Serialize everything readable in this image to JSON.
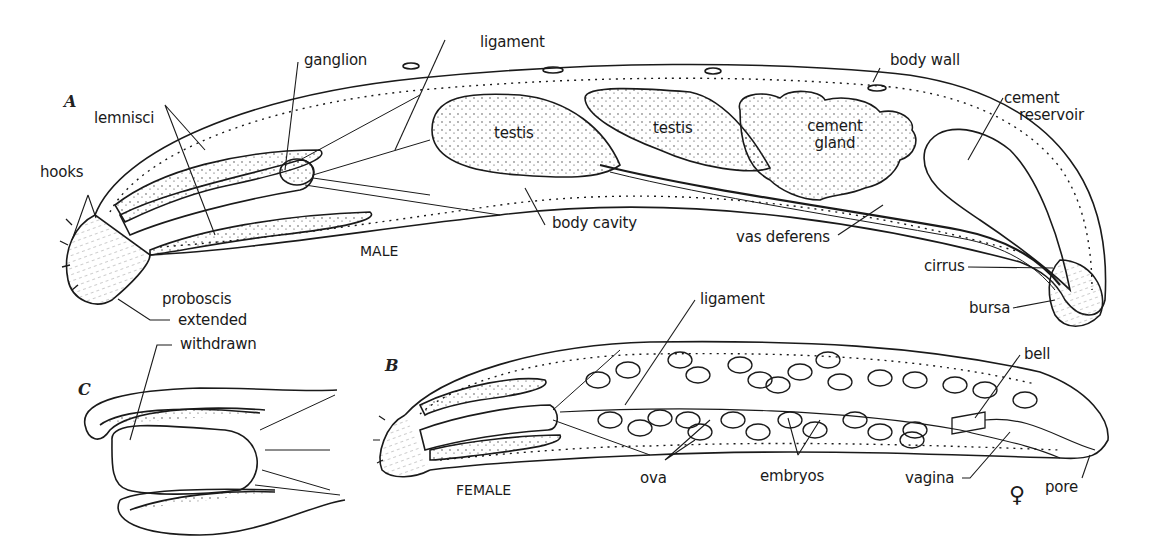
{
  "figure": {
    "panels": [
      {
        "id": "A",
        "letter": "A",
        "caption": "MALE"
      },
      {
        "id": "B",
        "letter": "B",
        "caption": "FEMALE",
        "symbol": "♀"
      },
      {
        "id": "C",
        "letter": "C",
        "caption": ""
      }
    ],
    "labels": {
      "male": {
        "hooks": "hooks",
        "lemnisci": "lemnisci",
        "ganglion": "ganglion",
        "ligament": "ligament",
        "testis_1": "testis",
        "testis_2": "testis",
        "cement_gland": "cement\ngland",
        "cement_gland_l1": "cement",
        "cement_gland_l2": "gland",
        "body_wall": "body wall",
        "cement_reservoir_l1": "cement",
        "cement_reservoir_l2": "reservoir",
        "body_cavity": "body cavity",
        "vas_deferens": "vas deferens",
        "cirrus": "cirrus",
        "bursa": "bursa",
        "proboscis": "proboscis",
        "extended": "extended"
      },
      "withdrawn": "withdrawn",
      "female": {
        "ligament": "ligament",
        "bell": "bell",
        "ova": "ova",
        "embryos": "embryos",
        "vagina": "vagina",
        "pore": "pore"
      }
    },
    "colors": {
      "ink": "#1a1a1a",
      "paper": "#ffffff"
    }
  }
}
